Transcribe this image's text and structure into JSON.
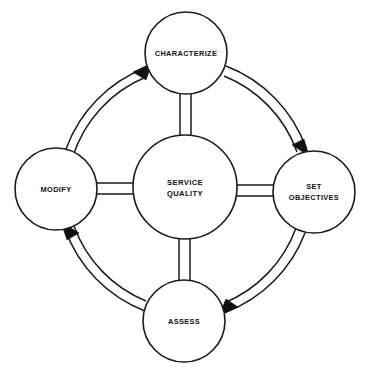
{
  "diagram": {
    "background_color": "#ffffff",
    "line_color": "#1a1a1a",
    "text_color": "#111111",
    "hub": {
      "id": "service-quality",
      "label_line1": "SERVICE",
      "label_line2": "QUALITY",
      "cx": 185,
      "cy": 187,
      "r": 52
    },
    "nodes": [
      {
        "id": "characterize",
        "label_line1": "CHARACTERIZE",
        "label_line2": "",
        "position": "top",
        "cx": 186,
        "cy": 53,
        "r": 41
      },
      {
        "id": "set-objectives",
        "label_line1": "SET",
        "label_line2": "OBJECTIVES",
        "position": "right",
        "cx": 314,
        "cy": 192,
        "r": 41
      },
      {
        "id": "assess",
        "label_line1": "ASSESS",
        "label_line2": "",
        "position": "bottom",
        "cx": 184,
        "cy": 321,
        "r": 41
      },
      {
        "id": "modify",
        "label_line1": "MODIFY",
        "label_line2": "",
        "position": "left",
        "cx": 56,
        "cy": 189,
        "r": 41
      }
    ],
    "spokes": [
      {
        "id": "spoke-hub-characterize",
        "from": "service-quality",
        "to": "characterize",
        "style": "double-line"
      },
      {
        "id": "spoke-hub-set-objectives",
        "from": "service-quality",
        "to": "set-objectives",
        "style": "double-line"
      },
      {
        "id": "spoke-hub-assess",
        "from": "service-quality",
        "to": "assess",
        "style": "double-line"
      },
      {
        "id": "spoke-hub-modify",
        "from": "service-quality",
        "to": "modify",
        "style": "double-line"
      }
    ],
    "arcs": [
      {
        "id": "arc-modify-to-characterize",
        "from": "modify",
        "to": "characterize",
        "style": "double-line-arrow",
        "direction": "clockwise"
      },
      {
        "id": "arc-characterize-to-set-objectives",
        "from": "characterize",
        "to": "set-objectives",
        "style": "double-line-arrow",
        "direction": "clockwise"
      },
      {
        "id": "arc-set-objectives-to-assess",
        "from": "set-objectives",
        "to": "assess",
        "style": "double-line-arrow",
        "direction": "clockwise"
      },
      {
        "id": "arc-assess-to-modify",
        "from": "assess",
        "to": "modify",
        "style": "double-line-arrow",
        "direction": "clockwise"
      }
    ]
  }
}
